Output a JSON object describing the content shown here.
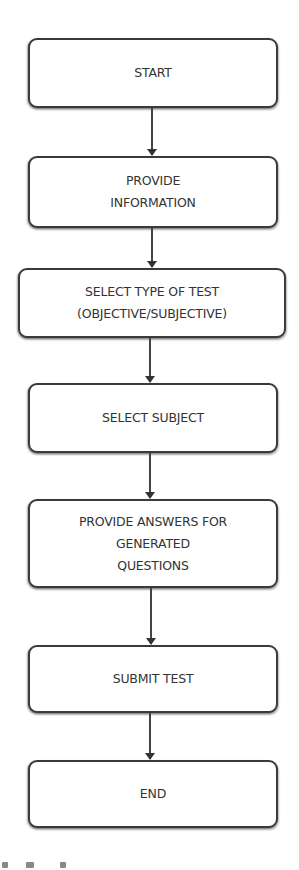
{
  "diagram": {
    "type": "flowchart",
    "direction": "top-to-bottom",
    "nodes": [
      {
        "id": "start",
        "label": "START"
      },
      {
        "id": "provide_info",
        "label": "PROVIDE\nINFORMATION"
      },
      {
        "id": "select_type",
        "label": "SELECT TYPE OF TEST\n(OBJECTIVE/SUBJECTIVE)"
      },
      {
        "id": "select_subject",
        "label": "SELECT SUBJECT"
      },
      {
        "id": "provide_answers",
        "label": "PROVIDE ANSWERS FOR\nGENERATED\nQUESTIONS"
      },
      {
        "id": "submit_test",
        "label": "SUBMIT TEST"
      },
      {
        "id": "end",
        "label": "END"
      }
    ],
    "edges": [
      {
        "from": "start",
        "to": "provide_info"
      },
      {
        "from": "provide_info",
        "to": "select_type"
      },
      {
        "from": "select_type",
        "to": "select_subject"
      },
      {
        "from": "select_subject",
        "to": "provide_answers"
      },
      {
        "from": "provide_answers",
        "to": "submit_test"
      },
      {
        "from": "submit_test",
        "to": "end"
      }
    ],
    "colors": {
      "border": "#3a3a3a",
      "text": "#333333",
      "background": "#ffffff"
    }
  }
}
